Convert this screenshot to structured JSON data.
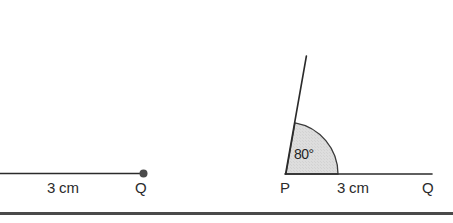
{
  "canvas": {
    "width": 453,
    "height": 223,
    "background": "#ffffff"
  },
  "style": {
    "stroke_color": "#2b2b2b",
    "sector_fill": "#dcdcdc",
    "sector_stroke": "#3a3a3a",
    "text_color": "#2b2b2b",
    "rule_color": "#4a4a4a"
  },
  "figures": [
    {
      "id": "figure-left",
      "name": "ray-segment-pq-partial",
      "point_label": "Q",
      "length_label": "3 cm",
      "endpoint_dot": true
    },
    {
      "id": "figure-right",
      "name": "angle-80-degrees-at-p",
      "vertex_label": "P",
      "point_label": "Q",
      "length_label": "3 cm",
      "angle_label": "80°",
      "angle_value": 80,
      "angle_unit": "degrees"
    }
  ],
  "left_figure": {
    "length_label": "3 cm",
    "q_label": "Q"
  },
  "right_figure": {
    "angle_label": "80°",
    "p_label": "P",
    "length_label": "3 cm",
    "q_label": "Q"
  },
  "divider": {
    "present": true
  }
}
